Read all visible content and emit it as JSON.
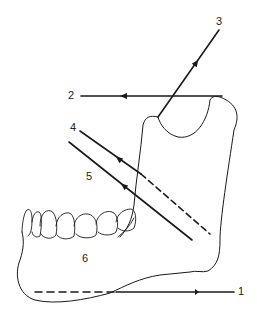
{
  "diagram": {
    "stroke_color": "#1a1a1a",
    "background": "#ffffff",
    "labels": [
      {
        "id": "1",
        "text": "1",
        "x": 238,
        "y": 286
      },
      {
        "id": "2",
        "text": "2",
        "x": 68,
        "y": 90
      },
      {
        "id": "3",
        "text": "3",
        "x": 216,
        "y": 16
      },
      {
        "id": "4",
        "text": "4",
        "x": 70,
        "y": 122
      },
      {
        "id": "5",
        "text": "5",
        "x": 86,
        "y": 171
      },
      {
        "id": "6",
        "text": "6",
        "x": 82,
        "y": 253
      }
    ]
  }
}
